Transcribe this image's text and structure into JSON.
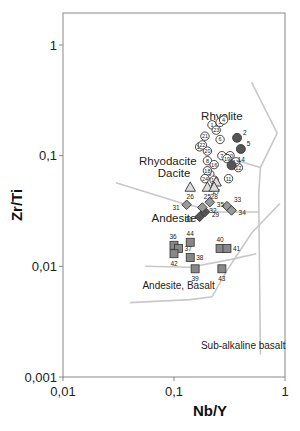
{
  "chart_data": {
    "type": "scatter",
    "title": "",
    "xlabel": "Nb/Y",
    "ylabel": "Zr/Ti",
    "xscale": "log",
    "yscale": "log",
    "xlim": [
      0.01,
      1
    ],
    "ylim": [
      0.001,
      1
    ],
    "grid": false,
    "x_ticks": [
      {
        "value": 0.01,
        "label": "0,01"
      },
      {
        "value": 0.1,
        "label": "0,1"
      },
      {
        "value": 1,
        "label": "1"
      }
    ],
    "y_ticks": [
      {
        "value": 0.001,
        "label": "0,001"
      },
      {
        "value": 0.01,
        "label": "0,01"
      },
      {
        "value": 0.1,
        "label": "0,1"
      },
      {
        "value": 1,
        "label": "1"
      }
    ],
    "field_labels": [
      {
        "text": "Rhyolite",
        "x": 0.27,
        "y": 0.21
      },
      {
        "text": "Rhyodacite",
        "x": 0.088,
        "y": 0.082
      },
      {
        "text": "Dacite",
        "x": 0.1,
        "y": 0.064
      },
      {
        "text": "Andesite",
        "x": 0.1,
        "y": 0.025
      },
      {
        "text": "Andesite, Basalt",
        "x": 0.11,
        "y": 0.0062
      },
      {
        "text": "Sub-alkaline basalt",
        "x": 0.42,
        "y": 0.0018
      }
    ],
    "field_boundaries": [
      {
        "name": "rhyolite-upper",
        "points": [
          [
            0.5,
            0.46
          ],
          [
            0.85,
            0.16
          ]
        ]
      },
      {
        "name": "rhyolite-comendite",
        "points": [
          [
            0.85,
            0.16
          ],
          [
            0.6,
            0.078
          ]
        ]
      },
      {
        "name": "rhyolite-rhyodacite",
        "points": [
          [
            0.3,
            0.096
          ],
          [
            0.6,
            0.078
          ]
        ]
      },
      {
        "name": "trachyandesite-right",
        "points": [
          [
            0.6,
            0.078
          ],
          [
            0.58,
            0.045
          ],
          [
            0.6,
            0.0016
          ]
        ]
      },
      {
        "name": "dacite-andesite",
        "points": [
          [
            0.03,
            0.057
          ],
          [
            0.12,
            0.037
          ],
          [
            0.25,
            0.031
          ],
          [
            0.58,
            0.031
          ]
        ]
      },
      {
        "name": "andesite-basalt",
        "points": [
          [
            0.055,
            0.01
          ],
          [
            0.14,
            0.0098
          ],
          [
            0.32,
            0.0115
          ],
          [
            0.55,
            0.013
          ]
        ]
      },
      {
        "name": "basalt-lower",
        "points": [
          [
            0.04,
            0.0047
          ],
          [
            0.14,
            0.005
          ],
          [
            0.22,
            0.0053
          ],
          [
            0.3,
            0.0092
          ],
          [
            0.5,
            0.02
          ],
          [
            0.9,
            0.037
          ]
        ]
      }
    ],
    "series": [
      {
        "name": "Open circles",
        "marker": "circle-open",
        "color": "#ffffff",
        "points": [
          {
            "label": "1",
            "x": 0.22,
            "y": 0.19
          },
          {
            "label": "3",
            "x": 0.26,
            "y": 0.2
          },
          {
            "label": "4",
            "x": 0.28,
            "y": 0.21
          },
          {
            "label": "6",
            "x": 0.26,
            "y": 0.14
          },
          {
            "label": "7",
            "x": 0.27,
            "y": 0.1
          },
          {
            "label": "8",
            "x": 0.2,
            "y": 0.09
          },
          {
            "label": "9",
            "x": 0.21,
            "y": 0.068
          },
          {
            "label": "10",
            "x": 0.32,
            "y": 0.1
          },
          {
            "label": "11",
            "x": 0.31,
            "y": 0.062
          },
          {
            "label": "12",
            "x": 0.38,
            "y": 0.078
          },
          {
            "label": "13",
            "x": 0.36,
            "y": 0.088
          },
          {
            "label": "15",
            "x": 0.17,
            "y": 0.12
          },
          {
            "label": "16",
            "x": 0.23,
            "y": 0.083
          },
          {
            "label": "17",
            "x": 0.23,
            "y": 0.06
          },
          {
            "label": "18",
            "x": 0.2,
            "y": 0.073
          },
          {
            "label": "19",
            "x": 0.3,
            "y": 0.094
          },
          {
            "label": "20",
            "x": 0.2,
            "y": 0.11
          },
          {
            "label": "21",
            "x": 0.19,
            "y": 0.15
          },
          {
            "label": "22",
            "x": 0.18,
            "y": 0.125
          },
          {
            "label": "23",
            "x": 0.24,
            "y": 0.17
          },
          {
            "label": "24",
            "x": 0.19,
            "y": 0.062
          }
        ]
      },
      {
        "name": "Filled circles",
        "marker": "circle-filled",
        "color": "#555555",
        "points": [
          {
            "label": "2",
            "x": 0.37,
            "y": 0.145
          },
          {
            "label": "5",
            "x": 0.4,
            "y": 0.115
          },
          {
            "label": "14",
            "x": 0.33,
            "y": 0.082
          }
        ]
      },
      {
        "name": "Triangles",
        "marker": "triangle",
        "color": "#dddddd",
        "points": [
          {
            "label": "25",
            "x": 0.2,
            "y": 0.052
          },
          {
            "label": "26",
            "x": 0.14,
            "y": 0.052
          },
          {
            "label": "27",
            "x": 0.24,
            "y": 0.058
          },
          {
            "label": "28",
            "x": 0.23,
            "y": 0.052
          }
        ]
      },
      {
        "name": "Diamonds",
        "marker": "diamond",
        "color": "#999999",
        "points": [
          {
            "label": "29",
            "x": 0.19,
            "y": 0.031
          },
          {
            "label": "30",
            "x": 0.17,
            "y": 0.028
          },
          {
            "label": "31",
            "x": 0.13,
            "y": 0.036
          },
          {
            "label": "32",
            "x": 0.18,
            "y": 0.034
          },
          {
            "label": "33",
            "x": 0.3,
            "y": 0.035
          },
          {
            "label": "34",
            "x": 0.33,
            "y": 0.032
          },
          {
            "label": "35",
            "x": 0.21,
            "y": 0.038
          }
        ]
      },
      {
        "name": "Squares",
        "marker": "square",
        "color": "#888888",
        "points": [
          {
            "label": "36",
            "x": 0.1,
            "y": 0.0155
          },
          {
            "label": "37",
            "x": 0.11,
            "y": 0.0145
          },
          {
            "label": "38",
            "x": 0.14,
            "y": 0.012
          },
          {
            "label": "39",
            "x": 0.155,
            "y": 0.0095
          },
          {
            "label": "40",
            "x": 0.26,
            "y": 0.0145
          },
          {
            "label": "41",
            "x": 0.3,
            "y": 0.0145
          },
          {
            "label": "42",
            "x": 0.1,
            "y": 0.013
          },
          {
            "label": "43",
            "x": 0.27,
            "y": 0.0095
          },
          {
            "label": "44",
            "x": 0.14,
            "y": 0.0165
          }
        ]
      }
    ]
  }
}
